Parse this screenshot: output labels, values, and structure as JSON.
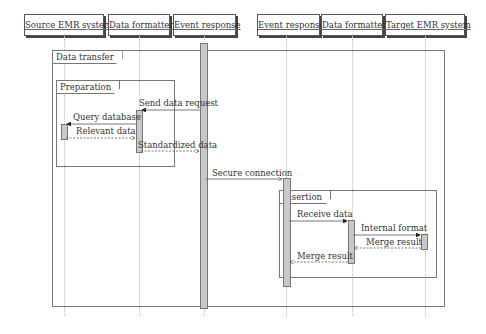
{
  "actors": [
    {
      "label": "Source EMR system"
    },
    {
      "label": "Data formatter"
    },
    {
      "label": "Event response"
    },
    {
      "label": "Event response"
    },
    {
      "label": "Data formatter"
    },
    {
      "label": "Target EMR system"
    }
  ],
  "frames": {
    "outer": "Data transfer",
    "preparation": "Preparation",
    "insertion": "Insertion"
  },
  "messages": {
    "send_data_request": "Send data request",
    "query_database": "Query database",
    "relevant_data": "Relevant data",
    "standardized_data": "Standardized data",
    "secure_connection": "Secure connection",
    "receive_data": "Receive data",
    "internal_format": "Internal format",
    "merge_result_1": "Merge result",
    "merge_result_2": "Merge result"
  }
}
